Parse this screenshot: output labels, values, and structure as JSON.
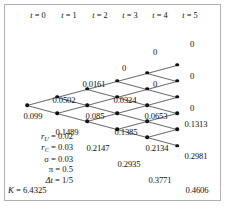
{
  "figure": {
    "type": "recombining-binomial-lattice",
    "columns": 6,
    "col_spacing_px": 30,
    "row_spacing_px": 16.2,
    "origin": {
      "x": 27,
      "y": 105
    }
  },
  "headers": [
    {
      "label": "t = 0",
      "var": "t",
      "value": "0",
      "x": 38
    },
    {
      "label": "t = 1",
      "var": "t",
      "value": "1",
      "x": 69
    },
    {
      "label": "t = 2",
      "var": "t",
      "value": "2",
      "x": 100
    },
    {
      "label": "t = 3",
      "var": "t",
      "value": "3",
      "x": 130
    },
    {
      "label": "t = 4",
      "var": "t",
      "value": "4",
      "x": 160
    },
    {
      "label": "t = 5",
      "var": "t",
      "value": "5",
      "x": 190
    }
  ],
  "parameters": [
    {
      "symbol": "r",
      "sub": "U",
      "eq": "=",
      "value": "0.02",
      "text": "r_U = 0.02"
    },
    {
      "symbol": "r",
      "sub": "C",
      "eq": "=",
      "value": "0.03",
      "text": "r_C = 0.03"
    },
    {
      "symbol": "σ",
      "sub": "",
      "eq": "=",
      "value": "0.03",
      "text": "σ = 0.03"
    },
    {
      "symbol": "π",
      "sub": "",
      "eq": "=",
      "value": "0.5",
      "text": "π = 0.5"
    },
    {
      "symbol": "Δt",
      "sub": "",
      "eq": "=",
      "value": "1/5",
      "text": "Δt = 1/5"
    },
    {
      "symbol": "K",
      "sub": "",
      "eq": "=",
      "value": "6.4325",
      "text": "K = 6.4325"
    }
  ],
  "lattice_values": [
    {
      "t": 0,
      "level": 0,
      "label": "0.099",
      "x": 33,
      "y": 116
    },
    {
      "t": 1,
      "level": 1,
      "label": "0.0502",
      "x": 64,
      "y": 100
    },
    {
      "t": 1,
      "level": -1,
      "label": "0.1489",
      "x": 67,
      "y": 132
    },
    {
      "t": 2,
      "level": 2,
      "label": "0.0161",
      "x": 94,
      "y": 84
    },
    {
      "t": 2,
      "level": 0,
      "label": "0.085",
      "x": 95,
      "y": 116
    },
    {
      "t": 2,
      "level": -2,
      "label": "0.2147",
      "x": 98,
      "y": 148
    },
    {
      "t": 3,
      "level": 3,
      "label": "0",
      "x": 124,
      "y": 68
    },
    {
      "t": 3,
      "level": 1,
      "label": "0.0324",
      "x": 125,
      "y": 100
    },
    {
      "t": 3,
      "level": -1,
      "label": "0.1385",
      "x": 126,
      "y": 132
    },
    {
      "t": 3,
      "level": -3,
      "label": "0.2935",
      "x": 129,
      "y": 164
    },
    {
      "t": 4,
      "level": 4,
      "label": "0",
      "x": 155,
      "y": 52
    },
    {
      "t": 4,
      "level": 2,
      "label": "0",
      "x": 155,
      "y": 84
    },
    {
      "t": 4,
      "level": 0,
      "label": "0.0653",
      "x": 156,
      "y": 116
    },
    {
      "t": 4,
      "level": -2,
      "label": "0.2134",
      "x": 157,
      "y": 148
    },
    {
      "t": 4,
      "level": -4,
      "label": "0.3771",
      "x": 160,
      "y": 180
    },
    {
      "t": 5,
      "level": 5,
      "label": "0",
      "x": 192,
      "y": 44
    },
    {
      "t": 5,
      "level": 3,
      "label": "0",
      "x": 192,
      "y": 76
    },
    {
      "t": 5,
      "level": 1,
      "label": "0",
      "x": 192,
      "y": 108
    },
    {
      "t": 5,
      "level": -1,
      "label": "0.1313",
      "x": 196,
      "y": 124
    },
    {
      "t": 5,
      "level": -3,
      "label": "0.2981",
      "x": 196,
      "y": 156
    },
    {
      "t": 5,
      "level": -5,
      "label": "0.4606",
      "x": 197,
      "y": 190
    }
  ],
  "chart_data": {
    "type": "lattice",
    "title": "",
    "xlabel": "t",
    "time_steps": [
      "0",
      "1",
      "2",
      "3",
      "4",
      "5"
    ],
    "nodes": [
      {
        "t": 0,
        "level": 0,
        "value": 0.099
      },
      {
        "t": 1,
        "level": 1,
        "value": 0.0502
      },
      {
        "t": 1,
        "level": -1,
        "value": 0.1489
      },
      {
        "t": 2,
        "level": 2,
        "value": 0.0161
      },
      {
        "t": 2,
        "level": 0,
        "value": 0.085
      },
      {
        "t": 2,
        "level": -2,
        "value": 0.2147
      },
      {
        "t": 3,
        "level": 3,
        "value": 0
      },
      {
        "t": 3,
        "level": 1,
        "value": 0.0324
      },
      {
        "t": 3,
        "level": -1,
        "value": 0.1385
      },
      {
        "t": 3,
        "level": -3,
        "value": 0.2935
      },
      {
        "t": 4,
        "level": 4,
        "value": 0
      },
      {
        "t": 4,
        "level": 2,
        "value": 0
      },
      {
        "t": 4,
        "level": 0,
        "value": 0.0653
      },
      {
        "t": 4,
        "level": -2,
        "value": 0.2134
      },
      {
        "t": 4,
        "level": -4,
        "value": 0.3771
      },
      {
        "t": 5,
        "level": 5,
        "value": 0
      },
      {
        "t": 5,
        "level": 3,
        "value": 0
      },
      {
        "t": 5,
        "level": 1,
        "value": 0
      },
      {
        "t": 5,
        "level": -1,
        "value": 0.1313
      },
      {
        "t": 5,
        "level": -3,
        "value": 0.2981
      },
      {
        "t": 5,
        "level": -5,
        "value": 0.4606
      }
    ],
    "parameters": {
      "r_U": 0.02,
      "r_C": 0.03,
      "sigma": 0.03,
      "pi": 0.5,
      "dt": "1/5",
      "K": 6.4325
    }
  }
}
